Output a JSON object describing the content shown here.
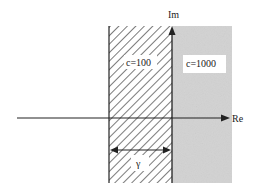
{
  "diagram": {
    "type": "complex-plane-regions",
    "axes": {
      "real_label": "Re",
      "imag_label": "Im"
    },
    "regions": [
      {
        "id": "hatched",
        "label": "c=100",
        "fill": "hatched"
      },
      {
        "id": "shaded",
        "label": "c=1000",
        "fill": "#d2d2d2"
      }
    ],
    "width_marker": {
      "label": "γ"
    },
    "colors": {
      "line": "#222222",
      "shade": "#d2d2d2",
      "hatch": "#333333",
      "background": "#ffffff"
    }
  }
}
